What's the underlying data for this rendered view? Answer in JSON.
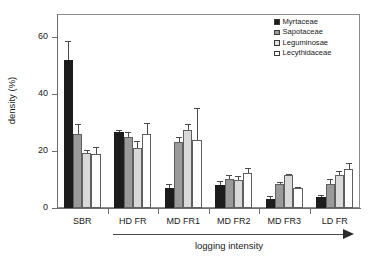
{
  "chart_data": {
    "type": "bar",
    "title": "",
    "xlabel": "logging intensity",
    "ylabel": "density (%)",
    "categories": [
      "SBR",
      "HD FR",
      "MD FR1",
      "MD FR2",
      "MD FR3",
      "LD FR"
    ],
    "ylim": [
      0,
      68
    ],
    "yticks": [
      0,
      20,
      40,
      60
    ],
    "ytick_labels": [
      "0",
      "20",
      "40",
      "60"
    ],
    "grid": false,
    "legend_position": "top-right",
    "series": [
      {
        "name": "Myrtaceae",
        "color": "#1c1c1c",
        "values": [
          52.0,
          26.5,
          7.0,
          8.0,
          3.0,
          4.0
        ],
        "errors": [
          6.5,
          1.0,
          1.5,
          1.5,
          1.2,
          0.4
        ]
      },
      {
        "name": "Sapotaceae",
        "color": "#9a9a9a",
        "values": [
          25.8,
          25.0,
          23.0,
          10.2,
          8.3,
          8.3
        ],
        "errors": [
          3.5,
          1.6,
          2.0,
          1.5,
          0.8,
          1.8
        ]
      },
      {
        "name": "Leguminosae",
        "color": "#d9d9d9",
        "values": [
          19.3,
          21.0,
          27.5,
          9.8,
          11.5,
          11.5
        ],
        "errors": [
          0.9,
          2.5,
          1.8,
          1.4,
          0.5,
          1.5
        ]
      },
      {
        "name": "Lecythidaceae",
        "color": "#ffffff",
        "values": [
          18.8,
          26.0,
          23.8,
          12.3,
          7.0,
          13.5
        ],
        "errors": [
          2.6,
          3.8,
          11.2,
          1.6,
          0.3,
          2.3
        ]
      }
    ]
  },
  "axis": {
    "y_title": "density (%)",
    "x_title": "logging intensity"
  },
  "legend": {
    "entries": [
      {
        "label": "Myrtaceae"
      },
      {
        "label": "Sapotaceae"
      },
      {
        "label": "Leguminosae"
      },
      {
        "label": "Lecythidaceae"
      }
    ]
  }
}
